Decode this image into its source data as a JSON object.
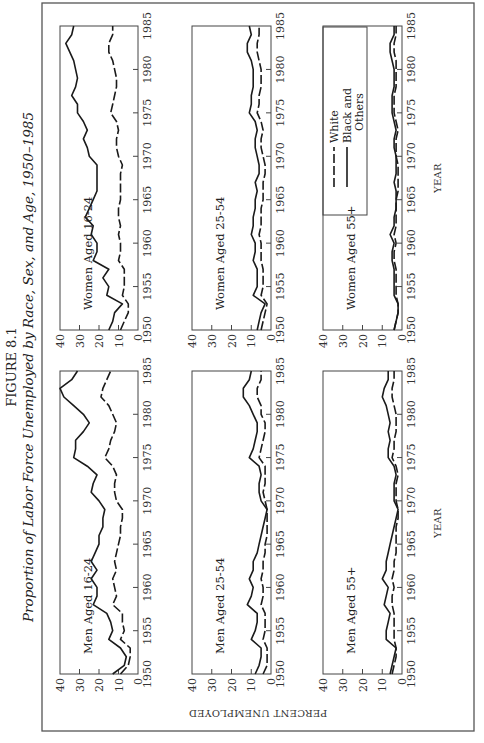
{
  "figure": {
    "label": "FIGURE 8.1",
    "title": "Proportion of Labor Force Unemployed by Race, Sex, and Age, 1950–1985",
    "orientation": "rotated 90° counter-clockwise on page",
    "y_axis_title": "PERCENT UNEMPLOYED",
    "x_axis_title": "YEAR"
  },
  "legend": {
    "items": [
      {
        "label": "White",
        "style": "dashed"
      },
      {
        "label": "Black and",
        "label2": "Others",
        "style": "solid"
      }
    ]
  },
  "colors": {
    "line": "#1a1a1a",
    "frame": "#555555",
    "background": "#ffffff"
  },
  "chart_data": [
    {
      "type": "line",
      "title": "Men Aged 16-24",
      "xlabel": "YEAR",
      "ylabel": "PERCENT UNEMPLOYED",
      "x": [
        1950,
        1951,
        1952,
        1953,
        1954,
        1955,
        1956,
        1957,
        1958,
        1959,
        1960,
        1961,
        1962,
        1963,
        1964,
        1965,
        1966,
        1967,
        1968,
        1969,
        1970,
        1971,
        1972,
        1973,
        1974,
        1975,
        1976,
        1977,
        1978,
        1979,
        1980,
        1981,
        1982,
        1983,
        1984,
        1985
      ],
      "xticks": [
        1950,
        1955,
        1960,
        1965,
        1970,
        1975,
        1980,
        1985
      ],
      "yticks": [
        0,
        10,
        20,
        30,
        40
      ],
      "ylim": [
        0,
        40
      ],
      "grid": false,
      "series": [
        {
          "name": "White",
          "style": "dashed",
          "values": [
            9,
            5,
            4,
            4,
            9,
            7,
            8,
            8,
            13,
            11,
            12,
            13,
            11,
            12,
            11,
            10,
            9,
            9,
            8,
            8,
            11,
            12,
            12,
            11,
            13,
            17,
            15,
            14,
            12,
            11,
            13,
            15,
            19,
            18,
            16,
            14
          ]
        },
        {
          "name": "Black and Others",
          "style": "solid",
          "values": [
            13,
            7,
            6,
            9,
            15,
            13,
            14,
            16,
            23,
            21,
            21,
            24,
            21,
            24,
            22,
            20,
            20,
            18,
            18,
            17,
            20,
            24,
            23,
            21,
            26,
            33,
            32,
            32,
            28,
            25,
            28,
            33,
            38,
            40,
            34,
            31
          ]
        }
      ]
    },
    {
      "type": "line",
      "title": "Women Aged 16-24",
      "xlabel": "YEAR",
      "ylabel": "PERCENT UNEMPLOYED",
      "x": [
        1950,
        1951,
        1952,
        1953,
        1954,
        1955,
        1956,
        1957,
        1958,
        1959,
        1960,
        1961,
        1962,
        1963,
        1964,
        1965,
        1966,
        1967,
        1968,
        1969,
        1970,
        1971,
        1972,
        1973,
        1974,
        1975,
        1976,
        1977,
        1978,
        1979,
        1980,
        1981,
        1982,
        1983,
        1984,
        1985
      ],
      "xticks": [
        1950,
        1955,
        1960,
        1965,
        1970,
        1975,
        1980,
        1985
      ],
      "yticks": [
        0,
        10,
        20,
        30,
        40
      ],
      "ylim": [
        0,
        40
      ],
      "grid": false,
      "series": [
        {
          "name": "White",
          "style": "dashed",
          "values": [
            9,
            7,
            5,
            5,
            8,
            7,
            7,
            7,
            10,
            9,
            9,
            10,
            9,
            10,
            10,
            9,
            9,
            9,
            9,
            8,
            10,
            11,
            11,
            10,
            11,
            14,
            13,
            12,
            11,
            11,
            12,
            13,
            15,
            15,
            13,
            13
          ]
        },
        {
          "name": "Black and Others",
          "style": "solid",
          "values": [
            15,
            13,
            12,
            8,
            16,
            15,
            18,
            15,
            23,
            21,
            21,
            24,
            23,
            27,
            25,
            23,
            21,
            21,
            21,
            21,
            25,
            26,
            28,
            26,
            28,
            31,
            31,
            34,
            32,
            31,
            32,
            33,
            35,
            37,
            34,
            33
          ]
        }
      ]
    },
    {
      "type": "line",
      "title": "Men Aged 25-54",
      "xlabel": "YEAR",
      "ylabel": "PERCENT UNEMPLOYED",
      "x": [
        1950,
        1951,
        1952,
        1953,
        1954,
        1955,
        1956,
        1957,
        1958,
        1959,
        1960,
        1961,
        1962,
        1963,
        1964,
        1965,
        1966,
        1967,
        1968,
        1969,
        1970,
        1971,
        1972,
        1973,
        1974,
        1975,
        1976,
        1977,
        1978,
        1979,
        1980,
        1981,
        1982,
        1983,
        1984,
        1985
      ],
      "xticks": [
        1950,
        1955,
        1960,
        1965,
        1970,
        1975,
        1980,
        1985
      ],
      "yticks": [
        0,
        10,
        20,
        30,
        40
      ],
      "ylim": [
        0,
        40
      ],
      "grid": false,
      "series": [
        {
          "name": "White",
          "style": "dashed",
          "values": [
            4,
            2,
            2,
            2,
            4,
            3,
            3,
            3,
            5,
            4,
            4,
            5,
            4,
            4,
            3,
            3,
            2,
            2,
            2,
            2,
            3,
            4,
            3,
            3,
            3,
            6,
            5,
            4,
            3,
            3,
            5,
            5,
            7,
            7,
            5,
            5
          ]
        },
        {
          "name": "Black and Others",
          "style": "solid",
          "values": [
            8,
            6,
            5,
            5,
            10,
            8,
            7,
            7,
            12,
            10,
            9,
            11,
            9,
            9,
            7,
            6,
            5,
            4,
            3,
            2,
            5,
            6,
            6,
            5,
            6,
            11,
            9,
            8,
            7,
            7,
            9,
            11,
            14,
            14,
            11,
            10
          ]
        }
      ]
    },
    {
      "type": "line",
      "title": "Women Aged 25-54",
      "xlabel": "YEAR",
      "ylabel": "PERCENT UNEMPLOYED",
      "x": [
        1950,
        1951,
        1952,
        1953,
        1954,
        1955,
        1956,
        1957,
        1958,
        1959,
        1960,
        1961,
        1962,
        1963,
        1964,
        1965,
        1966,
        1967,
        1968,
        1969,
        1970,
        1971,
        1972,
        1973,
        1974,
        1975,
        1976,
        1977,
        1978,
        1979,
        1980,
        1981,
        1982,
        1983,
        1984,
        1985
      ],
      "xticks": [
        1950,
        1955,
        1960,
        1965,
        1970,
        1975,
        1980,
        1985
      ],
      "yticks": [
        0,
        10,
        20,
        30,
        40
      ],
      "ylim": [
        0,
        40
      ],
      "grid": false,
      "series": [
        {
          "name": "White",
          "style": "dashed",
          "values": [
            5,
            4,
            3,
            2,
            5,
            4,
            4,
            4,
            5,
            5,
            5,
            6,
            5,
            5,
            5,
            4,
            4,
            4,
            3,
            3,
            4,
            5,
            5,
            4,
            5,
            7,
            6,
            6,
            5,
            5,
            5,
            6,
            7,
            7,
            6,
            6
          ]
        },
        {
          "name": "Black and Others",
          "style": "solid",
          "values": [
            7,
            6,
            5,
            3,
            9,
            7,
            7,
            7,
            9,
            8,
            8,
            10,
            9,
            9,
            8,
            8,
            7,
            8,
            6,
            6,
            7,
            8,
            8,
            7,
            8,
            11,
            10,
            10,
            9,
            9,
            9,
            10,
            12,
            12,
            10,
            11
          ]
        }
      ]
    },
    {
      "type": "line",
      "title": "Men Aged 55+",
      "xlabel": "YEAR",
      "ylabel": "PERCENT UNEMPLOYED",
      "x": [
        1950,
        1951,
        1952,
        1953,
        1954,
        1955,
        1956,
        1957,
        1958,
        1959,
        1960,
        1961,
        1962,
        1963,
        1964,
        1965,
        1966,
        1967,
        1968,
        1969,
        1970,
        1971,
        1972,
        1973,
        1974,
        1975,
        1976,
        1977,
        1978,
        1979,
        1980,
        1981,
        1982,
        1983,
        1984,
        1985
      ],
      "xticks": [
        1950,
        1955,
        1960,
        1965,
        1970,
        1975,
        1980,
        1985
      ],
      "yticks": [
        0,
        10,
        20,
        30,
        40
      ],
      "ylim": [
        0,
        40
      ],
      "grid": false,
      "series": [
        {
          "name": "White",
          "style": "dashed",
          "values": [
            5,
            4,
            3,
            3,
            4,
            4,
            4,
            4,
            5,
            5,
            4,
            5,
            4,
            4,
            3,
            3,
            3,
            3,
            2,
            2,
            3,
            3,
            3,
            2,
            3,
            5,
            4,
            4,
            3,
            3,
            3,
            4,
            5,
            5,
            4,
            4
          ]
        },
        {
          "name": "Black and Others",
          "style": "solid",
          "values": [
            6,
            5,
            4,
            3,
            8,
            8,
            7,
            6,
            9,
            8,
            7,
            10,
            8,
            8,
            7,
            6,
            5,
            4,
            3,
            2,
            4,
            4,
            4,
            3,
            4,
            7,
            7,
            6,
            7,
            6,
            7,
            8,
            10,
            9,
            7,
            7
          ]
        }
      ]
    },
    {
      "type": "line",
      "title": "Women Aged 55+",
      "xlabel": "YEAR",
      "ylabel": "PERCENT UNEMPLOYED",
      "x": [
        1950,
        1951,
        1952,
        1953,
        1954,
        1955,
        1956,
        1957,
        1958,
        1959,
        1960,
        1961,
        1962,
        1963,
        1964,
        1965,
        1966,
        1967,
        1968,
        1969,
        1970,
        1971,
        1972,
        1973,
        1974,
        1975,
        1976,
        1977,
        1978,
        1979,
        1980,
        1981,
        1982,
        1983,
        1984,
        1985
      ],
      "xticks": [
        1950,
        1955,
        1960,
        1965,
        1970,
        1975,
        1980,
        1985
      ],
      "yticks": [
        0,
        10,
        20,
        30,
        40
      ],
      "ylim": [
        0,
        40
      ],
      "grid": false,
      "series": [
        {
          "name": "White",
          "style": "dashed",
          "values": [
            4,
            3,
            2,
            2,
            3,
            3,
            3,
            3,
            4,
            4,
            3,
            4,
            3,
            3,
            3,
            3,
            2,
            2,
            2,
            2,
            3,
            3,
            3,
            2,
            3,
            4,
            4,
            4,
            3,
            3,
            3,
            3,
            4,
            4,
            3,
            3
          ]
        },
        {
          "name": "Black and Others",
          "style": "solid",
          "values": [
            4,
            3,
            2,
            2,
            4,
            4,
            4,
            4,
            5,
            5,
            4,
            6,
            4,
            4,
            3,
            3,
            3,
            4,
            3,
            3,
            3,
            4,
            4,
            3,
            4,
            5,
            5,
            5,
            4,
            4,
            4,
            5,
            6,
            6,
            4,
            4
          ]
        }
      ]
    }
  ]
}
